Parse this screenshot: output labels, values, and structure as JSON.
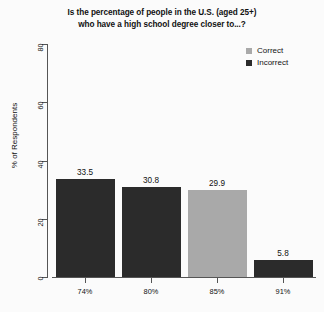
{
  "chart_data": {
    "type": "bar",
    "title": "Is the percentage of people in the U.S. (aged 25+) who have a high school degree closer to...?",
    "title_line1": "Is the percentage of people in the U.S. (aged 25+)",
    "title_line2": "who have a high school degree closer to...?",
    "xlabel": "",
    "ylabel": "% of Respondents",
    "categories": [
      "74%",
      "80%",
      "85%",
      "91%"
    ],
    "values": [
      33.5,
      30.8,
      29.9,
      5.8
    ],
    "value_labels": [
      "33.5",
      "30.8",
      "29.9",
      "5.8"
    ],
    "bar_groups": [
      "Incorrect",
      "Incorrect",
      "Correct",
      "Incorrect"
    ],
    "ylim": [
      0,
      80
    ],
    "yticks": [
      0,
      20,
      40,
      60,
      80
    ],
    "ytick_labels": [
      "0",
      "20",
      "40",
      "60",
      "80"
    ],
    "grid": false,
    "legend_position": "top-right",
    "legend": [
      {
        "label": "Correct",
        "color": "#a9a9a9"
      },
      {
        "label": "Incorrect",
        "color": "#2b2b2b"
      }
    ],
    "colors": {
      "correct": "#a9a9a9",
      "incorrect": "#2b2b2b",
      "axis": "#555555",
      "text": "#111111",
      "background": "#fbfbfb"
    }
  }
}
